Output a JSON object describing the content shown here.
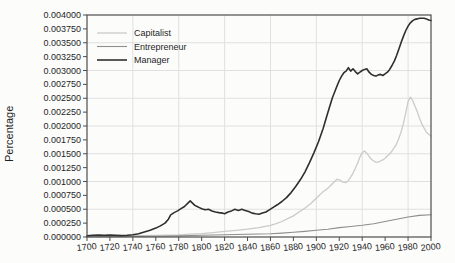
{
  "chart_data": {
    "type": "line",
    "title": "",
    "xlabel": "",
    "ylabel": "Percentage",
    "xlim": [
      1700,
      2000
    ],
    "ylim": [
      0,
      0.004
    ],
    "x_ticks": [
      1700,
      1720,
      1740,
      1760,
      1780,
      1800,
      1820,
      1840,
      1860,
      1880,
      1900,
      1920,
      1940,
      1960,
      1980,
      2000
    ],
    "y_ticks": [
      0,
      0.00025,
      0.0005,
      0.00075,
      0.001,
      0.00125,
      0.0015,
      0.00175,
      0.002,
      0.00225,
      0.0025,
      0.00275,
      0.003,
      0.00325,
      0.0035,
      0.00375,
      0.004
    ],
    "y_tick_labels": [
      "0.000000",
      "0.000250",
      "0.000500",
      "0.000750",
      "0.001000",
      "0.001250",
      "0.001500",
      "0.001750",
      "0.002000",
      "0.002250",
      "0.002500",
      "0.002750",
      "0.003000",
      "0.003250",
      "0.003500",
      "0.003750",
      "0.004000"
    ],
    "grid": {
      "on": true,
      "horizontal_values": [
        0.0005,
        0.001,
        0.0015,
        0.002,
        0.0025,
        0.003,
        0.0035
      ],
      "vertical_years": [
        1740,
        1780,
        1820,
        1860,
        1900,
        1940,
        1980
      ]
    },
    "legend": {
      "position": "top-left",
      "entries": [
        "Capitalist",
        "Entrepreneur",
        "Manager"
      ]
    },
    "colors": {
      "axis": "#4d4d4d",
      "grid": "#e0e0e0",
      "text": "#1f1f1f",
      "background": "#fcfcfb"
    },
    "series": [
      {
        "name": "Capitalist",
        "color": "#cbcbcb",
        "width": 1.3,
        "points": [
          [
            1700,
            1e-05
          ],
          [
            1720,
            1.5e-05
          ],
          [
            1740,
            2e-05
          ],
          [
            1760,
            3e-05
          ],
          [
            1780,
            4e-05
          ],
          [
            1790,
            5e-05
          ],
          [
            1800,
            6e-05
          ],
          [
            1810,
            8e-05
          ],
          [
            1820,
            0.0001
          ],
          [
            1830,
            0.00012
          ],
          [
            1840,
            0.00014
          ],
          [
            1850,
            0.00017
          ],
          [
            1860,
            0.00021
          ],
          [
            1865,
            0.00024
          ],
          [
            1870,
            0.00028
          ],
          [
            1875,
            0.00033
          ],
          [
            1880,
            0.00038
          ],
          [
            1885,
            0.00045
          ],
          [
            1890,
            0.00052
          ],
          [
            1895,
            0.0006
          ],
          [
            1900,
            0.0007
          ],
          [
            1905,
            0.0008
          ],
          [
            1910,
            0.00088
          ],
          [
            1914,
            0.00096
          ],
          [
            1918,
            0.00104
          ],
          [
            1920,
            0.00103
          ],
          [
            1923,
            0.00099
          ],
          [
            1926,
            0.00098
          ],
          [
            1928,
            0.00102
          ],
          [
            1930,
            0.00108
          ],
          [
            1932,
            0.00115
          ],
          [
            1934,
            0.00124
          ],
          [
            1936,
            0.00133
          ],
          [
            1938,
            0.00144
          ],
          [
            1940,
            0.00152
          ],
          [
            1942,
            0.00155
          ],
          [
            1944,
            0.00151
          ],
          [
            1946,
            0.00145
          ],
          [
            1948,
            0.0014
          ],
          [
            1950,
            0.00137
          ],
          [
            1952,
            0.00135
          ],
          [
            1954,
            0.00135
          ],
          [
            1956,
            0.00137
          ],
          [
            1958,
            0.00139
          ],
          [
            1960,
            0.00142
          ],
          [
            1962,
            0.00146
          ],
          [
            1964,
            0.0015
          ],
          [
            1966,
            0.00155
          ],
          [
            1968,
            0.00161
          ],
          [
            1970,
            0.00168
          ],
          [
            1972,
            0.00178
          ],
          [
            1974,
            0.0019
          ],
          [
            1976,
            0.00205
          ],
          [
            1978,
            0.00224
          ],
          [
            1980,
            0.00244
          ],
          [
            1982,
            0.00252
          ],
          [
            1984,
            0.00246
          ],
          [
            1986,
            0.00236
          ],
          [
            1988,
            0.00226
          ],
          [
            1990,
            0.00214
          ],
          [
            1992,
            0.00204
          ],
          [
            1994,
            0.00196
          ],
          [
            1996,
            0.00189
          ],
          [
            1998,
            0.00185
          ],
          [
            2000,
            0.00182
          ]
        ]
      },
      {
        "name": "Entrepreneur",
        "color": "#8e8e8e",
        "width": 1.1,
        "points": [
          [
            1700,
            5e-06
          ],
          [
            1720,
            8e-06
          ],
          [
            1740,
            1e-05
          ],
          [
            1760,
            1.5e-05
          ],
          [
            1780,
            2e-05
          ],
          [
            1800,
            3e-05
          ],
          [
            1820,
            4e-05
          ],
          [
            1840,
            5e-05
          ],
          [
            1860,
            6e-05
          ],
          [
            1870,
            7e-05
          ],
          [
            1880,
            8.5e-05
          ],
          [
            1890,
            0.0001
          ],
          [
            1900,
            0.00012
          ],
          [
            1910,
            0.00014
          ],
          [
            1920,
            0.00017
          ],
          [
            1930,
            0.00019
          ],
          [
            1940,
            0.00021
          ],
          [
            1950,
            0.00024
          ],
          [
            1960,
            0.00028
          ],
          [
            1970,
            0.00032
          ],
          [
            1980,
            0.00036
          ],
          [
            1990,
            0.00039
          ],
          [
            2000,
            0.0004
          ]
        ]
      },
      {
        "name": "Manager",
        "color": "#2f2f2f",
        "width": 1.6,
        "points": [
          [
            1700,
            2e-05
          ],
          [
            1705,
            3e-05
          ],
          [
            1710,
            3.5e-05
          ],
          [
            1715,
            3e-05
          ],
          [
            1720,
            3.5e-05
          ],
          [
            1725,
            3e-05
          ],
          [
            1730,
            2.5e-05
          ],
          [
            1735,
            3e-05
          ],
          [
            1740,
            4e-05
          ],
          [
            1745,
            6e-05
          ],
          [
            1750,
            9e-05
          ],
          [
            1755,
            0.00012
          ],
          [
            1760,
            0.00016
          ],
          [
            1764,
            0.0002
          ],
          [
            1768,
            0.00025
          ],
          [
            1771,
            0.00032
          ],
          [
            1773,
            0.0004
          ],
          [
            1776,
            0.00044
          ],
          [
            1779,
            0.00047
          ],
          [
            1782,
            0.00051
          ],
          [
            1785,
            0.00055
          ],
          [
            1788,
            0.00061
          ],
          [
            1790,
            0.00065
          ],
          [
            1792,
            0.00061
          ],
          [
            1794,
            0.00057
          ],
          [
            1796,
            0.00055
          ],
          [
            1798,
            0.00053
          ],
          [
            1800,
            0.00051
          ],
          [
            1803,
            0.00049
          ],
          [
            1806,
            0.0005
          ],
          [
            1809,
            0.00047
          ],
          [
            1812,
            0.00045
          ],
          [
            1815,
            0.00044
          ],
          [
            1818,
            0.00043
          ],
          [
            1820,
            0.00042
          ],
          [
            1823,
            0.00045
          ],
          [
            1826,
            0.00047
          ],
          [
            1829,
            0.0005
          ],
          [
            1832,
            0.00048
          ],
          [
            1835,
            0.0005
          ],
          [
            1838,
            0.00048
          ],
          [
            1841,
            0.00046
          ],
          [
            1844,
            0.00043
          ],
          [
            1847,
            0.00042
          ],
          [
            1850,
            0.00041
          ],
          [
            1853,
            0.00043
          ],
          [
            1856,
            0.00045
          ],
          [
            1859,
            0.00049
          ],
          [
            1862,
            0.00053
          ],
          [
            1866,
            0.00058
          ],
          [
            1870,
            0.00064
          ],
          [
            1874,
            0.00071
          ],
          [
            1878,
            0.0008
          ],
          [
            1882,
            0.00091
          ],
          [
            1886,
            0.00103
          ],
          [
            1890,
            0.00117
          ],
          [
            1894,
            0.00134
          ],
          [
            1898,
            0.00152
          ],
          [
            1902,
            0.00172
          ],
          [
            1906,
            0.00196
          ],
          [
            1910,
            0.00224
          ],
          [
            1914,
            0.00251
          ],
          [
            1918,
            0.00272
          ],
          [
            1920,
            0.00282
          ],
          [
            1922,
            0.0029
          ],
          [
            1924,
            0.00296
          ],
          [
            1926,
            0.00299
          ],
          [
            1928,
            0.00305
          ],
          [
            1930,
            0.00299
          ],
          [
            1932,
            0.00303
          ],
          [
            1934,
            0.00298
          ],
          [
            1936,
            0.00294
          ],
          [
            1938,
            0.00297
          ],
          [
            1940,
            0.003
          ],
          [
            1942,
            0.00302
          ],
          [
            1944,
            0.00303
          ],
          [
            1946,
            0.00297
          ],
          [
            1948,
            0.00293
          ],
          [
            1950,
            0.00291
          ],
          [
            1952,
            0.0029
          ],
          [
            1954,
            0.00292
          ],
          [
            1956,
            0.00293
          ],
          [
            1958,
            0.00291
          ],
          [
            1960,
            0.00294
          ],
          [
            1962,
            0.00297
          ],
          [
            1964,
            0.00302
          ],
          [
            1966,
            0.00309
          ],
          [
            1968,
            0.00317
          ],
          [
            1970,
            0.00327
          ],
          [
            1972,
            0.00339
          ],
          [
            1974,
            0.00351
          ],
          [
            1976,
            0.00362
          ],
          [
            1978,
            0.00372
          ],
          [
            1980,
            0.0038
          ],
          [
            1982,
            0.00386
          ],
          [
            1984,
            0.0039
          ],
          [
            1986,
            0.00392
          ],
          [
            1988,
            0.00393
          ],
          [
            1990,
            0.00394
          ],
          [
            1992,
            0.00394
          ],
          [
            1994,
            0.00394
          ],
          [
            1996,
            0.00393
          ],
          [
            1998,
            0.00391
          ],
          [
            2000,
            0.0039
          ]
        ]
      }
    ]
  }
}
